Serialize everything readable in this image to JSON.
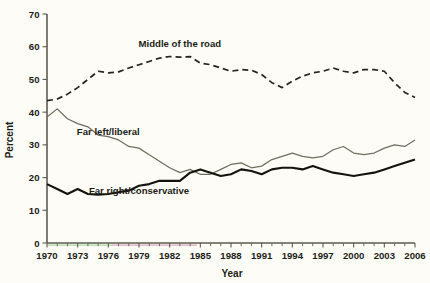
{
  "chart_data": {
    "type": "line",
    "title": "",
    "xlabel": "Year",
    "ylabel": "Percent",
    "xlim": [
      1970,
      2006
    ],
    "ylim": [
      0,
      70
    ],
    "yticks": [
      0,
      10,
      20,
      30,
      40,
      50,
      60,
      70
    ],
    "xticks": [
      1970,
      1973,
      1976,
      1979,
      1982,
      1985,
      1988,
      1991,
      1994,
      1997,
      2000,
      2003,
      2006
    ],
    "xtick_labels": [
      "1970",
      "1973",
      "1976",
      "1979",
      "1982",
      "1985",
      "1988",
      "1991",
      "1994",
      "1997",
      "2000",
      "2003",
      "2006"
    ],
    "ytick_labels": [
      "0",
      "10",
      "20",
      "30",
      "40",
      "50",
      "60",
      "70"
    ],
    "grid": false,
    "legend_position": "inline-annotations",
    "x": [
      1970,
      1971,
      1972,
      1973,
      1974,
      1975,
      1976,
      1977,
      1978,
      1979,
      1980,
      1981,
      1982,
      1983,
      1984,
      1985,
      1986,
      1987,
      1988,
      1989,
      1990,
      1991,
      1992,
      1993,
      1994,
      1995,
      1996,
      1997,
      1998,
      1999,
      2000,
      2001,
      2002,
      2003,
      2004,
      2005,
      2006
    ],
    "series": [
      {
        "name": "Middle of the road",
        "style": "dashed",
        "color": "#26241d",
        "label_x": 1983,
        "label_y": 60,
        "values": [
          43.5,
          44.0,
          45.5,
          47.5,
          50.0,
          52.5,
          52.0,
          52.3,
          53.5,
          54.5,
          55.5,
          56.5,
          57.0,
          56.8,
          57.0,
          55.0,
          54.5,
          53.5,
          52.5,
          53.0,
          52.8,
          51.5,
          49.0,
          47.5,
          49.5,
          51.0,
          52.0,
          52.5,
          53.5,
          52.5,
          52.0,
          53.0,
          53.0,
          52.5,
          49.0,
          46.0,
          44.5
        ]
      },
      {
        "name": "Far left/liberal",
        "style": "solid-thin",
        "color": "#6f6e61",
        "label_x": 1976,
        "label_y": 33,
        "values": [
          38.5,
          41.0,
          38.0,
          36.5,
          35.5,
          33.0,
          32.5,
          31.5,
          29.5,
          29.0,
          27.0,
          25.0,
          23.0,
          21.5,
          22.5,
          21.0,
          21.0,
          22.5,
          24.0,
          24.5,
          23.0,
          23.5,
          25.5,
          26.5,
          27.5,
          26.5,
          26.0,
          26.5,
          28.5,
          29.5,
          27.5,
          27.0,
          27.5,
          29.0,
          30.0,
          29.5,
          31.5
        ]
      },
      {
        "name": "Far right/conservative",
        "style": "solid-thick",
        "color": "#15130e",
        "label_x": 1979,
        "label_y": 15,
        "values": [
          18.0,
          16.5,
          15.0,
          16.5,
          15.0,
          14.8,
          15.0,
          15.5,
          16.0,
          17.5,
          18.0,
          19.0,
          19.0,
          19.0,
          21.5,
          22.5,
          21.5,
          20.5,
          21.0,
          22.5,
          22.0,
          21.0,
          22.5,
          23.0,
          23.0,
          22.5,
          23.5,
          22.5,
          21.5,
          21.0,
          20.5,
          21.0,
          21.5,
          22.5,
          23.5,
          24.5,
          25.5
        ]
      }
    ]
  }
}
